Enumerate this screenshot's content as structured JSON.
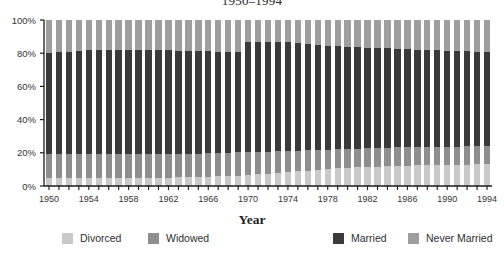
{
  "chart_data": {
    "type": "bar",
    "subtype": "stacked-percent",
    "title": "1950–1994",
    "xlabel": "Year",
    "ylabel": "",
    "ylim": [
      0,
      100
    ],
    "ytick_labels": [
      "0%",
      "20%",
      "40%",
      "60%",
      "80%",
      "100%"
    ],
    "ytick_values": [
      0,
      20,
      40,
      60,
      80,
      100
    ],
    "xtick_labels": [
      "1950",
      "1954",
      "1958",
      "1962",
      "1966",
      "1970",
      "1974",
      "1978",
      "1982",
      "1986",
      "1990",
      "1994"
    ],
    "xtick_values": [
      1950,
      1954,
      1958,
      1962,
      1966,
      1970,
      1974,
      1978,
      1982,
      1986,
      1990,
      1994
    ],
    "grid": false,
    "legend_position": "bottom",
    "stack_order_bottom_to_top": [
      "Divorced",
      "Widowed",
      "Married",
      "Never Married"
    ],
    "categories": [
      1950,
      1951,
      1952,
      1953,
      1954,
      1955,
      1956,
      1957,
      1958,
      1959,
      1960,
      1961,
      1962,
      1963,
      1964,
      1965,
      1966,
      1967,
      1968,
      1969,
      1970,
      1971,
      1972,
      1973,
      1974,
      1975,
      1976,
      1977,
      1978,
      1979,
      1980,
      1981,
      1982,
      1983,
      1984,
      1985,
      1986,
      1987,
      1988,
      1989,
      1990,
      1991,
      1992,
      1993,
      1994
    ],
    "series": [
      {
        "name": "Divorced",
        "color": "#c9c9c9",
        "values": [
          5.0,
          5.0,
          5.0,
          5.0,
          5.0,
          5.0,
          5.0,
          5.0,
          5.0,
          5.0,
          5.0,
          5.0,
          5.0,
          5.2,
          5.4,
          5.4,
          5.6,
          5.8,
          6.0,
          6.2,
          6.6,
          7.0,
          7.4,
          7.8,
          8.2,
          8.8,
          9.2,
          9.8,
          10.2,
          10.6,
          11.0,
          11.2,
          11.4,
          11.6,
          11.8,
          12.0,
          12.2,
          12.4,
          12.4,
          12.6,
          12.6,
          12.8,
          12.8,
          13.0,
          13.0
        ]
      },
      {
        "name": "Widowed",
        "color": "#8e8e8e",
        "values": [
          14.0,
          14.0,
          14.0,
          14.0,
          14.0,
          14.0,
          14.0,
          14.0,
          14.0,
          14.0,
          14.0,
          14.0,
          14.0,
          14.0,
          14.0,
          14.0,
          14.0,
          14.0,
          14.0,
          14.0,
          13.6,
          13.4,
          13.2,
          13.0,
          12.8,
          12.4,
          12.2,
          11.8,
          11.6,
          11.4,
          11.2,
          11.2,
          11.2,
          11.2,
          11.2,
          11.2,
          11.0,
          11.0,
          11.0,
          11.0,
          11.0,
          11.0,
          11.0,
          11.0,
          11.0
        ]
      },
      {
        "name": "Married",
        "color": "#3a3a3a",
        "values": [
          61.2,
          61.6,
          62.0,
          62.4,
          62.8,
          63.0,
          63.0,
          63.0,
          63.0,
          63.0,
          63.0,
          63.0,
          62.8,
          62.4,
          62.2,
          62.0,
          61.6,
          61.2,
          60.8,
          60.4,
          66.4,
          66.2,
          66.0,
          65.8,
          65.6,
          64.8,
          64.2,
          63.4,
          62.8,
          62.2,
          61.6,
          61.2,
          60.8,
          60.4,
          60.0,
          59.6,
          59.2,
          58.8,
          58.6,
          58.2,
          58.0,
          57.6,
          57.4,
          57.0,
          56.6
        ]
      },
      {
        "name": "Never Married",
        "color": "#9e9e9e",
        "values": [
          19.8,
          19.4,
          19.0,
          18.6,
          18.2,
          18.0,
          18.0,
          18.0,
          18.0,
          18.0,
          18.0,
          18.0,
          18.2,
          18.4,
          18.4,
          18.6,
          18.8,
          19.0,
          19.2,
          19.4,
          13.4,
          13.4,
          13.4,
          13.4,
          13.4,
          14.0,
          14.4,
          15.0,
          15.4,
          15.8,
          16.2,
          16.4,
          16.6,
          16.8,
          17.0,
          17.2,
          17.6,
          17.8,
          18.0,
          18.2,
          18.4,
          18.6,
          18.8,
          19.0,
          19.4
        ]
      }
    ]
  },
  "legend": {
    "items": [
      {
        "label": "Divorced",
        "color": "#c9c9c9",
        "x": 62
      },
      {
        "label": "Widowed",
        "color": "#8e8e8e",
        "x": 148
      },
      {
        "label": "Married",
        "color": "#3a3a3a",
        "x": 333
      },
      {
        "label": "Never Married",
        "color": "#9e9e9e",
        "x": 408
      }
    ]
  },
  "axes": {
    "x_title": "Year"
  },
  "colors": {
    "axis": "#1a1a1a",
    "text": "#2e2e2e",
    "background": "#ffffff"
  }
}
